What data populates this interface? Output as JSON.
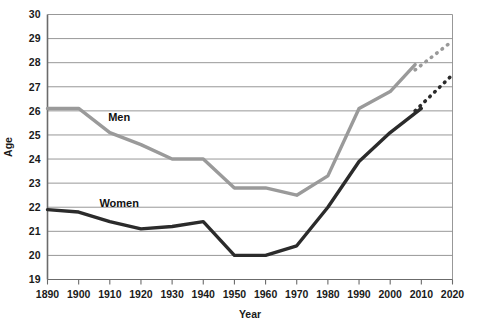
{
  "chart_data": {
    "type": "line",
    "title": "",
    "xlabel": "Year",
    "ylabel": "Age",
    "xlim": [
      1890,
      2020
    ],
    "ylim": [
      19,
      30
    ],
    "grid": true,
    "legend_position": "inline-labels",
    "x": [
      1890,
      1900,
      1910,
      1920,
      1930,
      1940,
      1950,
      1960,
      1970,
      1980,
      1990,
      2000,
      2010,
      2020
    ],
    "xticks": [
      "1890",
      "1900",
      "1910",
      "1920",
      "1930",
      "1940",
      "1950",
      "1960",
      "1970",
      "1980",
      "1990",
      "2000",
      "2010",
      "2020"
    ],
    "yticks": [
      "19",
      "20",
      "21",
      "22",
      "23",
      "24",
      "25",
      "26",
      "27",
      "28",
      "29",
      "30"
    ],
    "series": [
      {
        "name": "Men",
        "color": "#9a9a9a",
        "label": "Men",
        "values": [
          26.1,
          26.1,
          25.1,
          24.6,
          24.0,
          24.0,
          22.8,
          22.8,
          22.5,
          23.3,
          26.1,
          26.8,
          28.2,
          28.9
        ],
        "solid_through": 2008,
        "projection_style": "dotted",
        "projection_from": 2008,
        "projection_to": 2020,
        "projection_values": [
          27.7,
          28.9
        ]
      },
      {
        "name": "Women",
        "color": "#2b2b2b",
        "label": "Women",
        "values": [
          21.9,
          21.8,
          21.4,
          21.1,
          21.2,
          21.4,
          20.0,
          20.0,
          20.4,
          22.0,
          23.9,
          25.1,
          26.1,
          27.5
        ],
        "solid_through": 2010,
        "projection_style": "dotted",
        "projection_from": 2008,
        "projection_to": 2020,
        "projection_values": [
          26.0,
          27.5
        ]
      }
    ],
    "annotations": [
      {
        "text": "Men",
        "x": 1913,
        "y": 25.6
      },
      {
        "text": "Women",
        "x": 1913,
        "y": 22.0
      }
    ]
  }
}
